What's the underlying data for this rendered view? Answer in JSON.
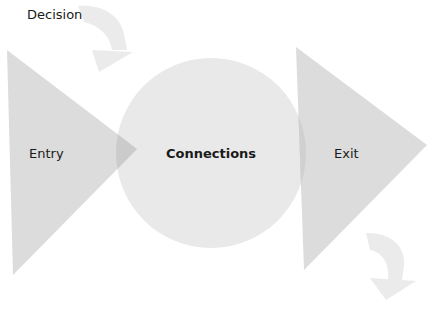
{
  "diagram": {
    "labels": {
      "decision": "Decision",
      "entry": "Entry",
      "connections": "Connections",
      "exit": "Exit"
    },
    "colors": {
      "background": "#ffffff",
      "triangle_fill": "#dcdcdc",
      "circle_fill": "#e9e9e9",
      "overlap_fill": "#cbcbcb",
      "arrow_fill": "#ebebeb",
      "text": "#1a1a1a"
    },
    "shapes": {
      "entry_triangle": {
        "type": "triangle",
        "points": "7,50 137,149 13,275"
      },
      "connections_circle": {
        "type": "circle",
        "cx": 211,
        "cy": 153,
        "r": 95
      },
      "exit_triangle": {
        "type": "triangle",
        "points": "296,47 427,145 304,270"
      },
      "decision_arrow": {
        "type": "curved-arrow",
        "direction": "clockwise-down"
      },
      "return_arrow": {
        "type": "curved-arrow",
        "direction": "clockwise-down"
      }
    }
  }
}
